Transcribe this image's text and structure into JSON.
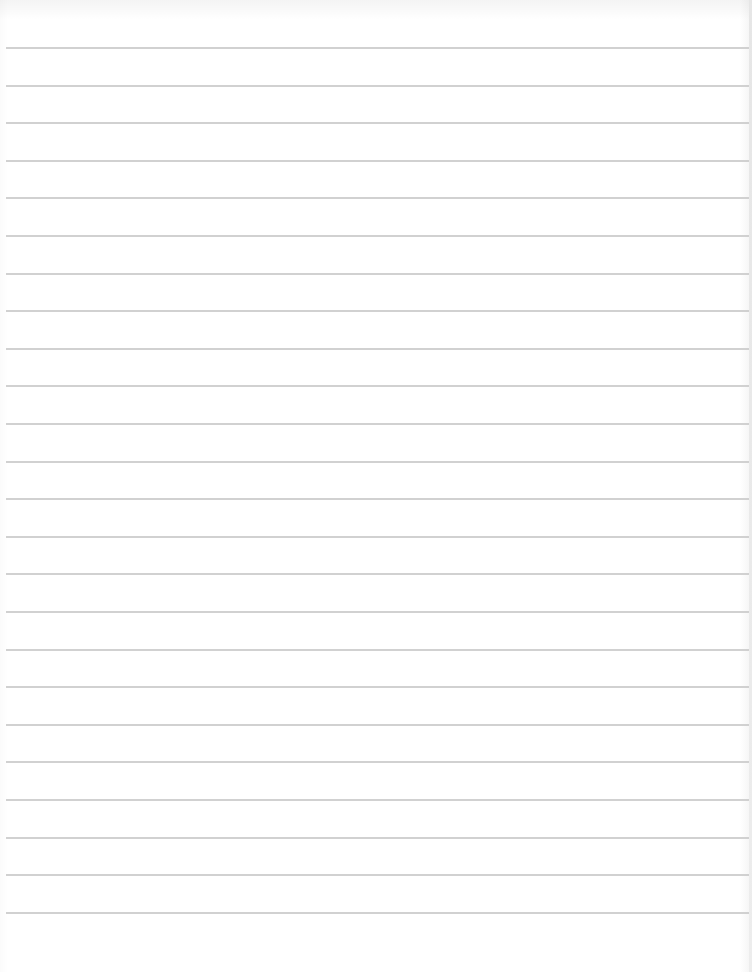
{
  "page": {
    "type": "blank-ruled-sheet",
    "background_color": "#ffffff",
    "rule_color": "#c9c9c9",
    "rule_count": 24,
    "first_rule_y": 47,
    "rule_spacing": 37.6,
    "text_content": ""
  }
}
